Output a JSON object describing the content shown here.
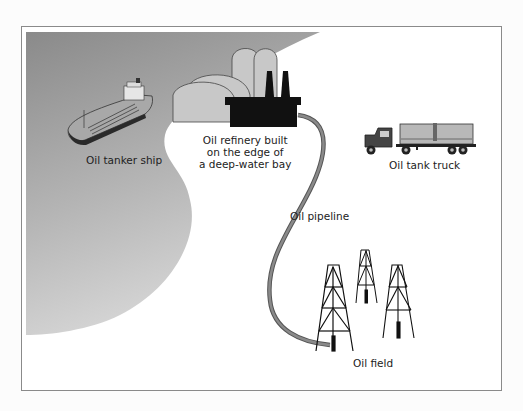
{
  "figure": {
    "labels": {
      "tanker": "Oil tanker ship",
      "refinery": [
        "Oil refinery built",
        "on the edge of",
        "a deep-water bay"
      ],
      "truck": "Oil tank truck",
      "pipeline": "Oil pipeline",
      "field": "Oil field"
    },
    "colors": {
      "water_dark": "#8c8c8c",
      "water_light": "#d4d4d4",
      "tank_fill": "#c8c8c8",
      "refinery": "#111111",
      "pipeline": "#6e6e6e",
      "frame": "#8a8a8a"
    }
  }
}
